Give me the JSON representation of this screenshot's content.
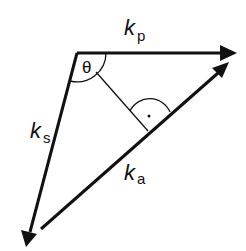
{
  "diagram": {
    "colors": {
      "stroke": "#111111",
      "background": "#ffffff"
    },
    "vectors": [
      {
        "id": "kp",
        "symbol": "k",
        "subscript": "p"
      },
      {
        "id": "ks",
        "symbol": "k",
        "subscript": "s"
      },
      {
        "id": "ka",
        "symbol": "k",
        "subscript": "a"
      }
    ],
    "angle_label": "θ",
    "right_angle_marker": "·"
  }
}
